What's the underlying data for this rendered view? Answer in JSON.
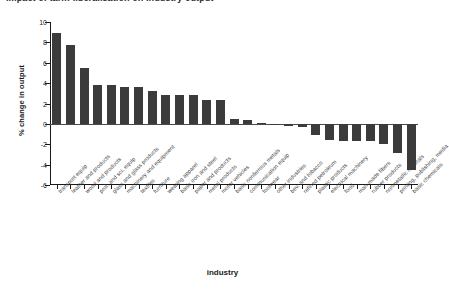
{
  "top_clipped_text": "impact of tariff liberalisation on industry output",
  "chart_data": {
    "type": "bar",
    "title": "",
    "xlabel": "industry",
    "ylabel": "% change in output",
    "ylim": [
      -6,
      10
    ],
    "yticks": [
      -6,
      -4,
      -2,
      0,
      2,
      4,
      6,
      8,
      10
    ],
    "ytick_labels": [
      "-6",
      "-4",
      "-2",
      "0",
      "2",
      "4",
      "6",
      "8",
      "10"
    ],
    "grid": false,
    "legend": "none",
    "bar_color": "#3b3b3b",
    "categories": [
      "transport equip",
      "leather and products",
      "wood and products",
      "prof. and sci. equip",
      "glass and glass products",
      "machinery and equipment",
      "textiles",
      "furniture",
      "wearing apparel",
      "basic iron and steel",
      "paper and products",
      "metal products",
      "motor vehicles",
      "basic nonferrous metals",
      "communication equip",
      "footwear",
      "other industries",
      "bev. and tobacco",
      "refined petroleum",
      "plastic products",
      "electrical machinery",
      "food",
      "man-made fibers",
      "rubber products",
      "nonmetallic minerals",
      "printing, publishing, media",
      "basic chemicals"
    ],
    "values": [
      8.9,
      7.7,
      5.5,
      3.8,
      3.8,
      3.6,
      3.6,
      3.2,
      2.8,
      2.8,
      2.8,
      2.3,
      2.3,
      0.5,
      0.4,
      0.05,
      -0.15,
      -0.2,
      -0.35,
      -1.1,
      -1.6,
      -1.7,
      -1.7,
      -1.7,
      -2.0,
      -2.9,
      -4.5
    ]
  }
}
